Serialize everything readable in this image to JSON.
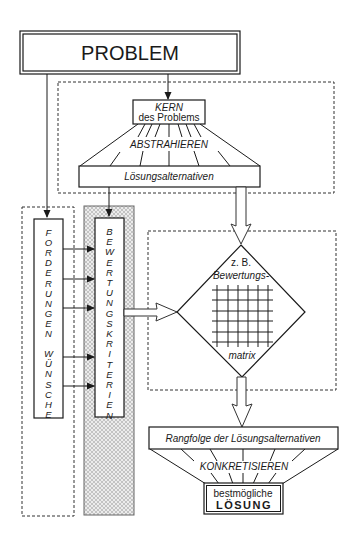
{
  "diagram": {
    "problem_label": "PROBLEM",
    "kern": {
      "line1": "KERN",
      "line2": "des Problems"
    },
    "abstrahieren_label": "ABSTRAHIEREN",
    "loesungsalternativen_label": "Lösungsalternativen",
    "forderungen": {
      "word1": "FORDERUNGEN",
      "word2": "WÜNSCHE",
      "letters": [
        "F",
        "O",
        "R",
        "D",
        "E",
        "R",
        "U",
        "N",
        "G",
        "E",
        "N",
        "",
        "W",
        "Ü",
        "N",
        "S",
        "C",
        "H",
        "E"
      ]
    },
    "bewertungskriterien": {
      "word": "BEWERTUNGSKRITERIEN",
      "letters": [
        "B",
        "E",
        "W",
        "E",
        "R",
        "T",
        "U",
        "N",
        "G",
        "S",
        "K",
        "R",
        "I",
        "T",
        "E",
        "R",
        "I",
        "E",
        "N"
      ]
    },
    "matrix": {
      "line1": "z. B.",
      "line2": "Bewertungs-",
      "line3": "matrix",
      "grid_rows": 6,
      "grid_cols": 6
    },
    "rangfolge_label": "Rangfolge der Lösungsalternativen",
    "konkretisieren_label": "KONKRETISIEREN",
    "loesung": {
      "line1": "bestmögliche",
      "line2": "LÖSUNG"
    },
    "colors": {
      "stroke": "#1a1a1a",
      "hatch_fill": "#d9d9d9",
      "background": "#ffffff"
    }
  }
}
